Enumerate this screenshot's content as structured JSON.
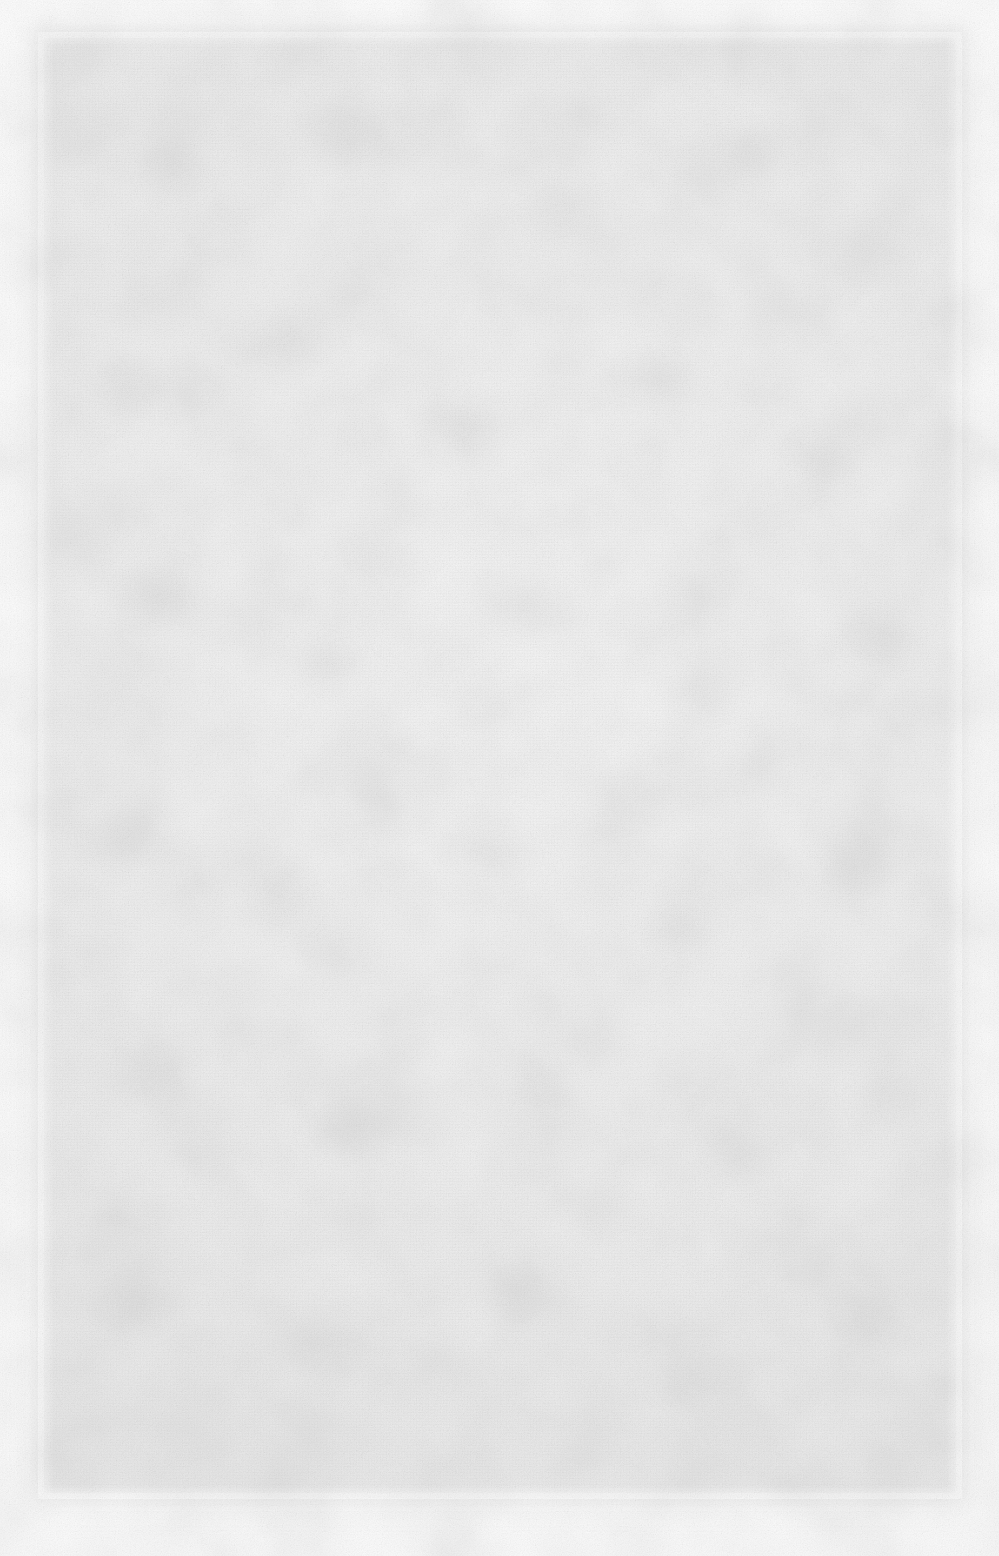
{
  "document": {
    "kind": "scanned-page",
    "title": "",
    "body_text": "",
    "is_blank": "true",
    "blank_note": "",
    "page_number": ""
  },
  "scan": {
    "width_px": 999,
    "height_px": 1556,
    "page_region": {
      "left_px": 44,
      "top_px": 38,
      "width_px": 912,
      "height_px": 1455
    },
    "colors": {
      "outer_margin": "#fdfdfd",
      "page_fill": "#ebebeb",
      "grain": "#b4b4b4",
      "blotch": "#aaaaaa"
    }
  },
  "regions": {
    "header": "",
    "main": "",
    "footer": ""
  }
}
